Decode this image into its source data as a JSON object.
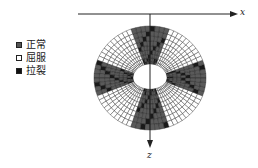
{
  "diagram": {
    "type": "tunnel-surrounding-rock-failure-zones",
    "axes": {
      "x_label": "x",
      "z_label": "z"
    },
    "legend": [
      {
        "label": "正常",
        "state": "normal",
        "color": "#555555"
      },
      {
        "label": "屈服",
        "state": "yield",
        "color": "#ffffff"
      },
      {
        "label": "拉裂",
        "state": "tensile-crack",
        "color": "#111111"
      }
    ],
    "mesh": {
      "center": [
        150,
        78
      ],
      "outer_rx": 56,
      "outer_rz": 52,
      "inner_rx": 17,
      "inner_rz": 14,
      "radial_layers": 9,
      "angular_segments": 72,
      "normal_sectors_deg": [
        [
          70,
          110
        ],
        [
          160,
          200
        ],
        [
          250,
          290
        ],
        [
          340,
          20
        ]
      ],
      "mesh_line_color": "#222222"
    }
  }
}
